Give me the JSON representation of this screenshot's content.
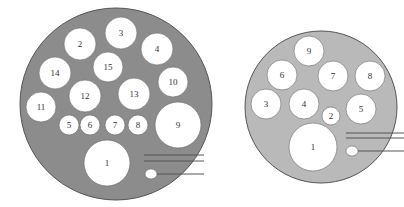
{
  "colors": {
    "left_disc": "#8c8c8c",
    "right_disc": "#b9b9b9",
    "hole": "#ffffff",
    "outline": "#555555",
    "line": "#555555"
  },
  "left_diagram": {
    "disc": {
      "cx": 116,
      "cy": 104,
      "r": 96
    },
    "holes": [
      {
        "label": "1",
        "cx": 107,
        "cy": 163,
        "r": 23
      },
      {
        "label": "2",
        "cx": 80,
        "cy": 44,
        "r": 16
      },
      {
        "label": "3",
        "cx": 121,
        "cy": 33,
        "r": 16
      },
      {
        "label": "4",
        "cx": 157,
        "cy": 49,
        "r": 16
      },
      {
        "label": "5",
        "cx": 69,
        "cy": 125,
        "r": 10
      },
      {
        "label": "6",
        "cx": 90,
        "cy": 125,
        "r": 10
      },
      {
        "label": "7",
        "cx": 115,
        "cy": 125,
        "r": 10
      },
      {
        "label": "8",
        "cx": 138,
        "cy": 125,
        "r": 10
      },
      {
        "label": "9",
        "cx": 178,
        "cy": 125,
        "r": 23
      },
      {
        "label": "10",
        "cx": 173,
        "cy": 82,
        "r": 15
      },
      {
        "label": "11",
        "cx": 41,
        "cy": 107,
        "r": 15
      },
      {
        "label": "12",
        "cx": 85,
        "cy": 96,
        "r": 16
      },
      {
        "label": "13",
        "cx": 134,
        "cy": 94,
        "r": 16
      },
      {
        "label": "14",
        "cx": 55,
        "cy": 73,
        "r": 16
      },
      {
        "label": "15",
        "cx": 108,
        "cy": 67,
        "r": 15
      }
    ],
    "small_hole": {
      "cx": 151,
      "cy": 174,
      "rx": 6,
      "ry": 5
    },
    "lines": [
      {
        "x1": 144,
        "y1": 155,
        "x2": 204,
        "y2": 155
      },
      {
        "x1": 144,
        "y1": 161,
        "x2": 204,
        "y2": 161
      },
      {
        "x1": 157,
        "y1": 174,
        "x2": 204,
        "y2": 174
      }
    ]
  },
  "right_diagram": {
    "disc": {
      "cx": 321,
      "cy": 107,
      "r": 76
    },
    "holes": [
      {
        "label": "1",
        "cx": 313,
        "cy": 147,
        "r": 24
      },
      {
        "label": "2",
        "cx": 331,
        "cy": 116,
        "r": 9
      },
      {
        "label": "3",
        "cx": 266,
        "cy": 104,
        "r": 15
      },
      {
        "label": "4",
        "cx": 304,
        "cy": 104,
        "r": 15
      },
      {
        "label": "5",
        "cx": 361,
        "cy": 109,
        "r": 15
      },
      {
        "label": "6",
        "cx": 282,
        "cy": 75,
        "r": 15
      },
      {
        "label": "7",
        "cx": 333,
        "cy": 76,
        "r": 15
      },
      {
        "label": "8",
        "cx": 370,
        "cy": 76,
        "r": 15
      },
      {
        "label": "9",
        "cx": 309,
        "cy": 51,
        "r": 15
      }
    ],
    "small_hole": {
      "cx": 352,
      "cy": 151,
      "rx": 6,
      "ry": 5
    },
    "lines": [
      {
        "x1": 346,
        "y1": 133,
        "x2": 404,
        "y2": 133
      },
      {
        "x1": 346,
        "y1": 138,
        "x2": 404,
        "y2": 138
      },
      {
        "x1": 358,
        "y1": 151,
        "x2": 404,
        "y2": 151
      }
    ]
  }
}
